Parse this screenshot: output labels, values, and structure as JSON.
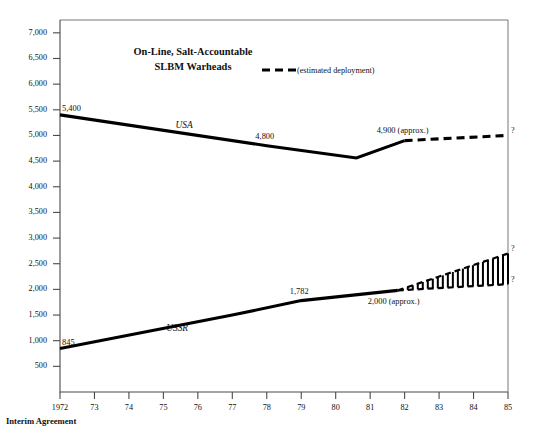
{
  "chart_data": {
    "type": "line",
    "title": "On-Line, Salt-Accountable SLBM Warheads",
    "title_line1": "On-Line, Salt-Accountable",
    "title_line2": "SLBM Warheads",
    "xlabel": "",
    "ylabel": "",
    "xlim": [
      1972,
      1985
    ],
    "ylim": [
      0,
      7250
    ],
    "grid": false,
    "legend": [
      {
        "label": "(estimated deployment)",
        "style": "dashed",
        "color": "#000000"
      }
    ],
    "legend_position": "top-center-right",
    "x": [
      1972,
      1973,
      1974,
      1975,
      1976,
      1977,
      1978,
      1979,
      1980,
      1981,
      1982,
      1983,
      1984,
      1985
    ],
    "xtick_labels": [
      "1972",
      "73",
      "74",
      "75",
      "76",
      "77",
      "78",
      "79",
      "80",
      "81",
      "82",
      "83",
      "84",
      "85"
    ],
    "ytick_values": [
      500,
      1000,
      1500,
      2000,
      2500,
      3000,
      3500,
      4000,
      4500,
      5000,
      5500,
      6000,
      6500,
      7000
    ],
    "ytick_labels": [
      "500",
      "1,000",
      "1,500",
      "2,000",
      "2,500",
      "3,000",
      "3,500",
      "4,000",
      "4,500",
      "5,000",
      "5,500",
      "6,000",
      "6,500",
      "7,000"
    ],
    "series": [
      {
        "name": "USA",
        "style": "solid",
        "color": "#000000",
        "x": [
          1972,
          1978,
          1980.6,
          1982
        ],
        "values": [
          5400,
          4800,
          4560,
          4900
        ]
      },
      {
        "name": "USA estimated",
        "style": "dashed",
        "color": "#000000",
        "x": [
          1982,
          1985
        ],
        "values": [
          4900,
          5000
        ]
      },
      {
        "name": "USSR",
        "style": "solid",
        "color": "#000000",
        "x": [
          1972,
          1977,
          1979,
          1981.8
        ],
        "values": [
          845,
          1500,
          1782,
          1980
        ]
      },
      {
        "name": "USSR estimated range upper",
        "style": "dashed",
        "color": "#000000",
        "x": [
          1981.8,
          1985
        ],
        "values": [
          1980,
          2700
        ]
      },
      {
        "name": "USSR estimated range lower",
        "style": "dashed",
        "color": "#000000",
        "x": [
          1981.8,
          1985
        ],
        "values": [
          1980,
          2100
        ]
      }
    ],
    "annotations": [
      {
        "text": "5,400",
        "x": 1972,
        "y": 5400,
        "series": "USA"
      },
      {
        "text": "4,800",
        "x": 1978,
        "y": 4800,
        "series": "USA"
      },
      {
        "text": "4,900 (approx.)",
        "x": 1982,
        "y": 4900,
        "series": "USA"
      },
      {
        "text": "845",
        "x": 1972,
        "y": 845,
        "series": "USSR"
      },
      {
        "text": "1,782",
        "x": 1979,
        "y": 1782,
        "series": "USSR"
      },
      {
        "text": "2,000 (approx.)",
        "x": 1981.8,
        "y": 1980,
        "series": "USSR"
      },
      {
        "text": "?",
        "x": 1985,
        "y": 5000,
        "series": "USA"
      },
      {
        "text": "?",
        "x": 1985,
        "y": 2700,
        "series": "USSR"
      },
      {
        "text": "?",
        "x": 1985,
        "y": 2100,
        "series": "USSR"
      }
    ],
    "series_labels": [
      {
        "text": "USA",
        "x": 1975.6,
        "y": 5150
      },
      {
        "text": "USSR",
        "x": 1975.4,
        "y": 1180
      }
    ],
    "footnote": "Interim Agreement"
  }
}
